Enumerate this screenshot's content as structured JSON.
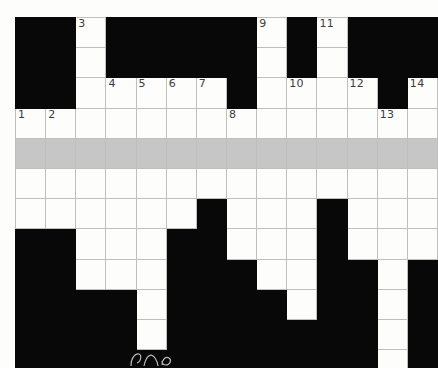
{
  "puzzle": {
    "type": "crossword-grid",
    "title": "Crossword puzzle grid",
    "columns": 14,
    "rows": 12,
    "cell_size_px": 29,
    "colors": {
      "block": "#080808",
      "cell": "#fdfdfc",
      "shaded_row": "#c6c6c6",
      "gridline": "#bfbfbf",
      "number_text": "#3b3b3b",
      "page_background": "#ffffff"
    },
    "shaded_row_index": 4,
    "legend": {
      "0": "white (fillable) cell",
      "1": "black (blocked) cell",
      "2": "shaded (highlighted) cell"
    },
    "cells": [
      [
        1,
        1,
        0,
        1,
        1,
        1,
        1,
        1,
        0,
        1,
        0,
        1,
        1,
        1
      ],
      [
        1,
        1,
        0,
        1,
        1,
        1,
        1,
        1,
        0,
        1,
        0,
        1,
        1,
        1
      ],
      [
        1,
        1,
        0,
        0,
        0,
        0,
        0,
        1,
        0,
        0,
        0,
        0,
        1,
        0
      ],
      [
        0,
        0,
        0,
        0,
        0,
        0,
        0,
        0,
        0,
        0,
        0,
        0,
        0,
        0
      ],
      [
        2,
        2,
        2,
        2,
        2,
        2,
        2,
        2,
        2,
        2,
        2,
        2,
        2,
        2
      ],
      [
        0,
        0,
        0,
        0,
        0,
        0,
        0,
        0,
        0,
        0,
        0,
        0,
        0,
        0
      ],
      [
        0,
        0,
        0,
        0,
        0,
        0,
        1,
        0,
        0,
        0,
        1,
        0,
        0,
        0
      ],
      [
        1,
        1,
        0,
        0,
        0,
        1,
        1,
        0,
        0,
        0,
        1,
        0,
        0,
        0
      ],
      [
        1,
        1,
        0,
        0,
        0,
        1,
        1,
        1,
        0,
        0,
        1,
        1,
        0,
        1
      ],
      [
        1,
        1,
        1,
        1,
        0,
        1,
        1,
        1,
        1,
        0,
        1,
        1,
        0,
        1
      ],
      [
        1,
        1,
        1,
        1,
        0,
        1,
        1,
        1,
        1,
        1,
        1,
        1,
        0,
        1
      ],
      [
        1,
        1,
        1,
        1,
        1,
        1,
        1,
        1,
        1,
        1,
        1,
        1,
        0,
        1
      ]
    ],
    "numbers": [
      {
        "row": 0,
        "col": 2,
        "label": "3"
      },
      {
        "row": 0,
        "col": 8,
        "label": "9"
      },
      {
        "row": 0,
        "col": 10,
        "label": "11"
      },
      {
        "row": 2,
        "col": 3,
        "label": "4"
      },
      {
        "row": 2,
        "col": 4,
        "label": "5"
      },
      {
        "row": 2,
        "col": 5,
        "label": "6"
      },
      {
        "row": 2,
        "col": 6,
        "label": "7"
      },
      {
        "row": 2,
        "col": 9,
        "label": "10"
      },
      {
        "row": 2,
        "col": 11,
        "label": "12"
      },
      {
        "row": 2,
        "col": 13,
        "label": "14"
      },
      {
        "row": 3,
        "col": 0,
        "label": "1"
      },
      {
        "row": 3,
        "col": 1,
        "label": "2"
      },
      {
        "row": 3,
        "col": 7,
        "label": "8"
      },
      {
        "row": 3,
        "col": 12,
        "label": "13"
      }
    ],
    "clue_number_list": [
      "1",
      "2",
      "3",
      "4",
      "5",
      "6",
      "7",
      "8",
      "9",
      "10",
      "11",
      "12",
      "13",
      "14"
    ],
    "entered_letters": []
  }
}
